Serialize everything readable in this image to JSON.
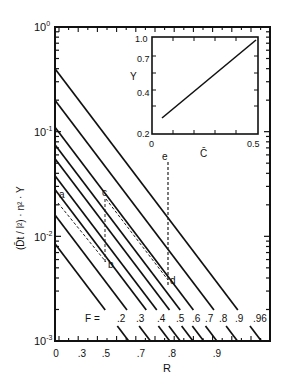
{
  "chart_data": {
    "type": "line",
    "title": "",
    "xlabel": "R",
    "ylabel": "(D̄t / l²) · n² · Y",
    "yscale": "log",
    "ylim": [
      0.001,
      1
    ],
    "y_ticks": [
      {
        "base": "10",
        "exp": "0",
        "value": 1
      },
      {
        "base": "10",
        "exp": "-1",
        "value": 0.1
      },
      {
        "base": "10",
        "exp": "-2",
        "value": 0.01
      },
      {
        "base": "10",
        "exp": "-3",
        "value": 0.001
      }
    ],
    "x_tick_labels": [
      {
        "label": "0",
        "px": 56
      },
      {
        "label": ".3",
        "px": 82
      },
      {
        "label": ".5",
        "px": 106
      },
      {
        "label": ".7",
        "px": 141
      },
      {
        "label": ".8",
        "px": 172
      },
      {
        "label": ".9",
        "px": 217
      }
    ],
    "grid": false,
    "legend_prefix": "F =",
    "series": [
      {
        "name": ".2",
        "label_px": 117,
        "start_y": 0.0085,
        "end_x_px": 136
      },
      {
        "name": ".3",
        "label_px": 136,
        "start_y": 0.016,
        "end_x_px": 152
      },
      {
        "name": ".4",
        "label_px": 157,
        "start_y": 0.028,
        "end_x_px": 172
      },
      {
        "name": ".5",
        "label_px": 176,
        "start_y": 0.038,
        "end_x_px": 186
      },
      {
        "name": ".6",
        "label_px": 192,
        "start_y": 0.055,
        "end_x_px": 202
      },
      {
        "name": ".7",
        "label_px": 205,
        "start_y": 0.075,
        "end_x_px": 215
      },
      {
        "name": ".8",
        "label_px": 219,
        "start_y": 0.11,
        "end_x_px": 229
      },
      {
        "name": ".9",
        "label_px": 235,
        "start_y": 0.2,
        "end_x_px": 248
      },
      {
        "name": ".96",
        "label_px": 253,
        "start_y": 0.4,
        "end_x_px": 268
      }
    ],
    "annotations": [
      {
        "label": "a",
        "x_px": 59,
        "y_px": 198
      },
      {
        "label": "b",
        "x_px": 108,
        "y_px": 268
      },
      {
        "label": "c",
        "x_px": 102,
        "y_px": 196
      },
      {
        "label": "d",
        "x_px": 170,
        "y_px": 284
      },
      {
        "label": "e",
        "x_px": 162,
        "y_px": 160
      }
    ],
    "inset": {
      "type": "line",
      "xlabel": "C̄",
      "ylabel": "Y",
      "x_tick_labels": [
        "0",
        "0.5"
      ],
      "y_tick_labels": [
        "1.0",
        "0.7",
        "0.4",
        "0.2"
      ],
      "xlim": [
        0,
        0.5
      ],
      "ylim": [
        0.2,
        1.0
      ],
      "yscale": "log",
      "points": [
        [
          0.04,
          0.28
        ],
        [
          0.5,
          1.0
        ]
      ]
    }
  }
}
